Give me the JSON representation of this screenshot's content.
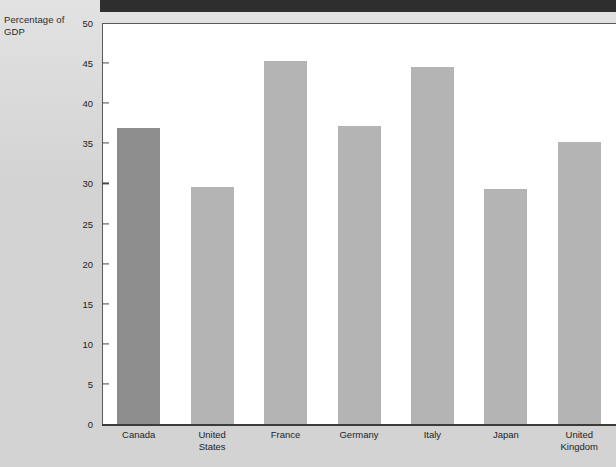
{
  "chart_data": {
    "type": "bar",
    "title": "",
    "ylabel": "Percentage of GDP",
    "xlabel": "",
    "ylim": [
      0,
      50
    ],
    "yticks": [
      0,
      5,
      10,
      15,
      20,
      25,
      30,
      35,
      40,
      45,
      50
    ],
    "grid": false,
    "legend": null,
    "categories": [
      "Canada",
      "United States",
      "France",
      "Germany",
      "Italy",
      "Japan",
      "United Kingdom"
    ],
    "values": [
      36.9,
      29.6,
      45.3,
      37.1,
      44.5,
      29.3,
      35.2
    ],
    "colors": {
      "highlight_bar": "#8d8d8d",
      "default_bar": "#b4b4b4",
      "axis": "#4a4a4a",
      "plot_background": "#ffffff",
      "page_background": "#d3d3d3",
      "banner": "#2e2e2e"
    },
    "highlight_category": "Canada"
  },
  "axis": {
    "y_title_line1": "Percentage of",
    "y_title_line2": "GDP",
    "y_tick_labels": [
      "50",
      "45",
      "40",
      "35",
      "30",
      "25",
      "20",
      "15",
      "10",
      "5",
      "0"
    ]
  },
  "x_labels": [
    {
      "line1": "Canada",
      "line2": ""
    },
    {
      "line1": "United",
      "line2": "States"
    },
    {
      "line1": "France",
      "line2": ""
    },
    {
      "line1": "Germany",
      "line2": ""
    },
    {
      "line1": "Italy",
      "line2": ""
    },
    {
      "line1": "Japan",
      "line2": ""
    },
    {
      "line1": "United",
      "line2": "Kingdom"
    }
  ]
}
